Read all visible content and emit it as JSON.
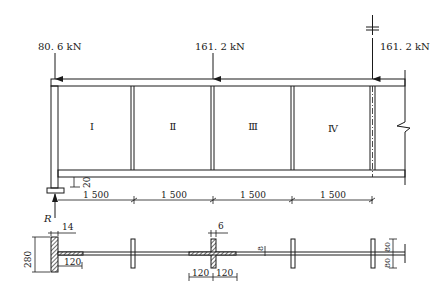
{
  "diagram": {
    "type": "plate-girder-elevation-and-section",
    "colors": {
      "line": "#1a1a1a",
      "background": "#ffffff",
      "hatch": "#333333"
    },
    "loads": [
      {
        "id": "load-left",
        "label": "80. 6 kN"
      },
      {
        "id": "load-mid",
        "label": "161. 2 kN"
      },
      {
        "id": "load-right",
        "label": "161. 2 kN"
      }
    ],
    "panels": [
      {
        "label": "I"
      },
      {
        "label": "Ⅱ"
      },
      {
        "label": "Ⅲ"
      },
      {
        "label": "Ⅳ"
      }
    ],
    "support": {
      "reaction_label": "R",
      "bearing_offset_label": "20"
    },
    "spans": [
      {
        "label": "1 500"
      },
      {
        "label": "1 500"
      },
      {
        "label": "1 500"
      },
      {
        "label": "1 500"
      }
    ],
    "section": {
      "end_stiffener_thickness": "14",
      "end_stiffener_height": "280",
      "end_weld_length": "120",
      "mid_stiffener_thickness": "6",
      "mid_weld_left": "120",
      "mid_weld_right": "120",
      "web_thickness": "8",
      "stiffener_width_top": "80",
      "stiffener_width_bottom": "80"
    }
  }
}
